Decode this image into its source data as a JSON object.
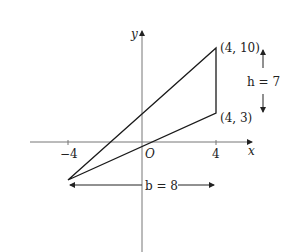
{
  "diagram": {
    "axes": {
      "x_label": "x",
      "y_label": "y",
      "origin_label": "O"
    },
    "ticks": {
      "x_neg": "−4",
      "x_pos": "4"
    },
    "vertices": [
      {
        "label": "(4, 10)",
        "x": 4,
        "y": 10
      },
      {
        "label": "(4, 3)",
        "x": 4,
        "y": 3
      },
      {
        "label": "",
        "x": -4,
        "y": -4
      }
    ],
    "height_label": "h = 7",
    "base_label": "b = 8",
    "colors": {
      "line": "#1a1a1a",
      "axis": "#777777",
      "background": "#ffffff"
    }
  }
}
